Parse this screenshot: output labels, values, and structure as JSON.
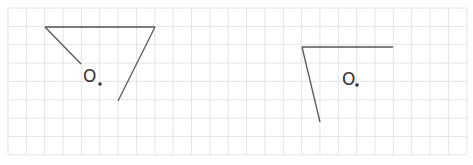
{
  "grid": {
    "x0": 8,
    "y0": 8,
    "cell": 18.35,
    "cols": 25,
    "rows": 8,
    "line_color": "#e4e4e4"
  },
  "figures": [
    {
      "name": "left-figure",
      "label": "O",
      "label_pos": [
        83,
        82
      ],
      "dot": [
        100,
        84
      ],
      "segments": [
        [
          45,
          27,
          81,
          64
        ],
        [
          45,
          27,
          155,
          27
        ],
        [
          155,
          27,
          118,
          101
        ]
      ]
    },
    {
      "name": "right-figure",
      "label": "O",
      "label_pos": [
        342,
        85
      ],
      "dot": [
        357,
        85
      ],
      "segments": [
        [
          302,
          47,
          393,
          47
        ],
        [
          302,
          47,
          320,
          122
        ]
      ]
    }
  ],
  "stroke_color": "#555555"
}
